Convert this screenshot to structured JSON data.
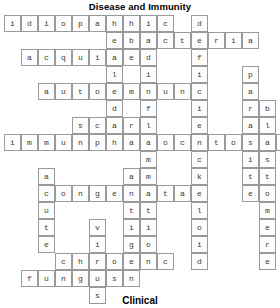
{
  "puzzle": {
    "title_top": "Disease and Immunity",
    "title_bottom": "Clinical",
    "cell_size": 17,
    "origin_x": 4,
    "origin_y": 15,
    "grid_cols": 16,
    "grid_rows": 16,
    "entries": [
      {
        "word": "idiopathic",
        "dir": "across",
        "row": 0,
        "col": 0
      },
      {
        "word": "bacteria",
        "dir": "across",
        "row": 1,
        "col": 7
      },
      {
        "word": "acquired",
        "dir": "across",
        "row": 2,
        "col": 1
      },
      {
        "word": "autoimmune",
        "dir": "across",
        "row": 4,
        "col": 2
      },
      {
        "word": "scar",
        "dir": "across",
        "row": 6,
        "col": 4
      },
      {
        "word": "immunity",
        "dir": "across",
        "row": 7,
        "col": 0
      },
      {
        "word": "phagocytosis",
        "dir": "across",
        "row": 7,
        "col": 5
      },
      {
        "word": "congenital",
        "dir": "across",
        "row": 10,
        "col": 2
      },
      {
        "word": "chronic",
        "dir": "across",
        "row": 14,
        "col": 3
      },
      {
        "word": "fungus",
        "dir": "across",
        "row": 15,
        "col": 1
      },
      {
        "word": "deficiency",
        "dir": "down",
        "row": 0,
        "col": 11
      },
      {
        "word": "healed",
        "dir": "down",
        "row": 0,
        "col": 6
      },
      {
        "word": "inflammation",
        "dir": "down",
        "row": 3,
        "col": 8
      },
      {
        "word": "parasite",
        "dir": "down",
        "row": 3,
        "col": 14
      },
      {
        "word": "blastomere",
        "dir": "down",
        "row": 5,
        "col": 15
      },
      {
        "word": "acute",
        "dir": "down",
        "row": 9,
        "col": 2
      },
      {
        "word": "antigen",
        "dir": "down",
        "row": 9,
        "col": 7
      },
      {
        "word": "keloid",
        "dir": "down",
        "row": 9,
        "col": 11
      },
      {
        "word": "virus",
        "dir": "down",
        "row": 12,
        "col": 5
      }
    ]
  }
}
